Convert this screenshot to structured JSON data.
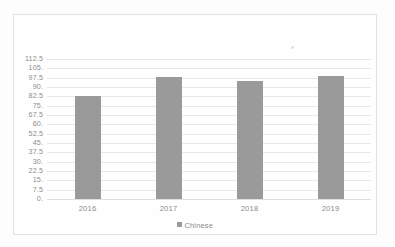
{
  "chart_data": {
    "type": "bar",
    "title": "",
    "xlabel": "",
    "ylabel": "",
    "categories": [
      "2016",
      "2017",
      "2018",
      "2019"
    ],
    "series": [
      {
        "name": "Chinese",
        "color": "#9a9a9a",
        "values": [
          83,
          98,
          95,
          99
        ]
      }
    ],
    "ylim": [
      0,
      112.5
    ],
    "ystep": 7.5,
    "ytick_labels": [
      "112.5",
      "105.",
      "97.5",
      "90.",
      "82.5",
      "75.",
      "67.5",
      "60.",
      "52.5",
      "45.",
      "37.5",
      "30.",
      "22.5",
      "15.",
      "7.5",
      "0."
    ],
    "ytick_values": [
      112.5,
      105,
      97.5,
      90,
      82.5,
      75,
      67.5,
      60,
      52.5,
      45,
      37.5,
      30,
      22.5,
      15,
      7.5,
      0
    ],
    "grid": true,
    "legend_position": "bottom"
  },
  "legend": {
    "entries": [
      {
        "label": "Chinese",
        "color": "#9a9a9a",
        "swatch_icon": "square-swatch-icon"
      }
    ]
  },
  "colors": {
    "bar": "#9a9a9a",
    "gridline": "#e8e8e8",
    "axis_text": "#8a8a8a",
    "frame_border": "#e2e2e2",
    "page_background": "#fdfdfd"
  }
}
